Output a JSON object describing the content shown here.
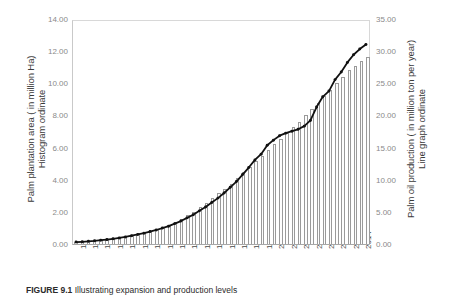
{
  "caption": {
    "label": "FIGURE 9.1",
    "text": "Illustrating expansion and production levels"
  },
  "chart_data": {
    "type": "bar",
    "title": "",
    "xlabel": "",
    "ylabel": "Palm plantation area ( in million Ha) Histogram ordinate",
    "y2label": "Palm oil production ( in million ton per year) Line graph ordinate",
    "grid": false,
    "legend": "none",
    "ylim": [
      0,
      14
    ],
    "y2lim": [
      0,
      35
    ],
    "yticks": [
      "0.00",
      "2.00",
      "4.00",
      "6.00",
      "8.00",
      "10.00",
      "12.00",
      "14.00"
    ],
    "y2ticks": [
      "0.00",
      "5.00",
      "10.00",
      "15.00",
      "20.00",
      "25.00",
      "30.00",
      "35.00"
    ],
    "xticklabels": [
      "1968",
      "1970",
      "1972",
      "1974",
      "1976",
      "1978",
      "1980",
      "1982",
      "1984",
      "1986",
      "1988",
      "1990",
      "1992",
      "1994",
      "1996",
      "1998",
      "2000",
      "2002",
      "2004",
      "2006",
      "2008",
      "2010",
      "2012",
      "2014"
    ],
    "x": [
      1968,
      1969,
      1970,
      1971,
      1972,
      1973,
      1974,
      1975,
      1976,
      1977,
      1978,
      1979,
      1980,
      1981,
      1982,
      1983,
      1984,
      1985,
      1986,
      1987,
      1988,
      1989,
      1990,
      1991,
      1992,
      1993,
      1994,
      1995,
      1996,
      1997,
      1998,
      1999,
      2000,
      2001,
      2002,
      2003,
      2004,
      2005,
      2006,
      2007,
      2008,
      2009,
      2010,
      2011,
      2012,
      2013,
      2014,
      2015
    ],
    "series": [
      {
        "name": "Palm plantation area ( in million Ha)",
        "axis": "left",
        "render": "bar",
        "unit": "million Ha",
        "values": [
          0.12,
          0.14,
          0.17,
          0.2,
          0.24,
          0.28,
          0.33,
          0.39,
          0.45,
          0.52,
          0.6,
          0.69,
          0.8,
          0.92,
          1.05,
          1.2,
          1.38,
          1.57,
          1.79,
          2.02,
          2.28,
          2.55,
          2.85,
          3.15,
          3.45,
          3.75,
          4.1,
          4.45,
          4.8,
          5.15,
          5.5,
          5.85,
          6.2,
          6.55,
          6.9,
          7.25,
          7.6,
          8.0,
          8.4,
          8.8,
          9.2,
          9.6,
          10.0,
          10.4,
          10.8,
          11.1,
          11.4,
          11.65
        ]
      },
      {
        "name": "Palm oil production ( in million ton per year)",
        "axis": "right",
        "render": "line",
        "unit": "million ton per year",
        "values": [
          0.3,
          0.35,
          0.42,
          0.5,
          0.6,
          0.7,
          0.82,
          0.95,
          1.1,
          1.3,
          1.5,
          1.7,
          1.95,
          2.2,
          2.5,
          2.8,
          3.2,
          3.6,
          4.1,
          4.6,
          5.2,
          5.8,
          6.5,
          7.2,
          8.0,
          8.9,
          9.8,
          10.9,
          12.0,
          13.2,
          14.1,
          15.5,
          16.3,
          17.0,
          17.4,
          17.7,
          18.0,
          18.5,
          19.4,
          21.5,
          23.1,
          24.0,
          25.8,
          27.0,
          28.5,
          29.7,
          30.6,
          31.3
        ]
      }
    ]
  }
}
